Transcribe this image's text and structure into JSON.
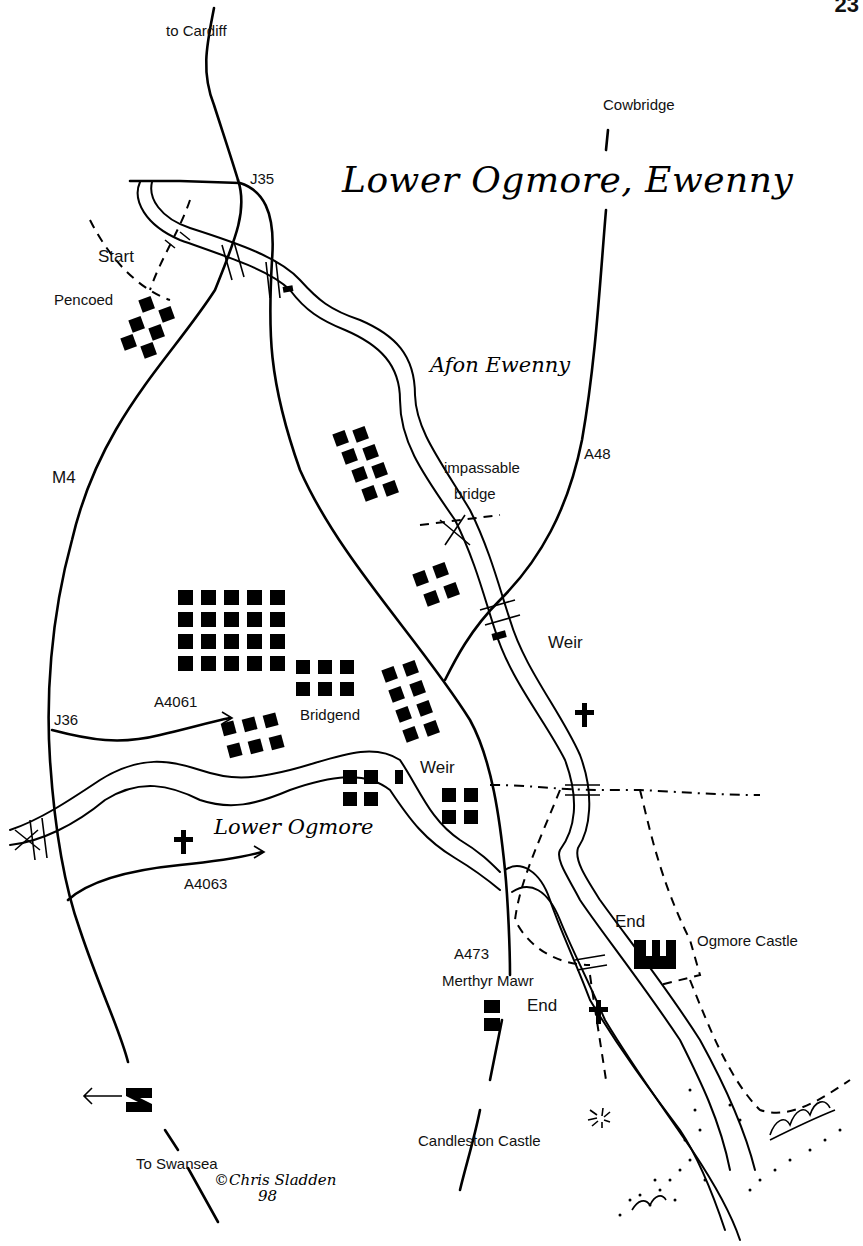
{
  "page": {
    "number_partial": "23"
  },
  "map": {
    "title": "Lower Ogmore, Ewenny",
    "rivers": [
      {
        "name": "Afon Ewenny"
      },
      {
        "name": "Lower Ogmore"
      }
    ],
    "places": {
      "start": "Start",
      "pencoed": "Pencoed",
      "bridgend": "Bridgend",
      "merthyr_mawr": "Merthyr Mawr",
      "ogmore_castle": "Ogmore Castle",
      "candleston_castle": "Candleston Castle",
      "end_1": "End",
      "end_2": "End"
    },
    "directions": {
      "to_cardiff": "to Cardiff",
      "cowbridge": "Cowbridge",
      "to_swansea": "To Swansea"
    },
    "roads": {
      "m4": "M4",
      "j35": "J35",
      "j36": "J36",
      "a48": "A48",
      "a4061": "A4061",
      "a4063": "A4063",
      "a473": "A473"
    },
    "features": {
      "impassable_bridge_1": "impassable",
      "impassable_bridge_2": "bridge",
      "weir_1": "Weir",
      "weir_2": "Weir"
    },
    "north_arrow": {
      "label": "N",
      "direction": "left"
    },
    "credit": {
      "copyright": "©",
      "author": "Chris Sladden",
      "year": "98"
    },
    "icons": {
      "church": "church-cross-icon",
      "castle": "castle-icon",
      "ruin": "ruin-icon",
      "building": "building-block-icon"
    }
  }
}
